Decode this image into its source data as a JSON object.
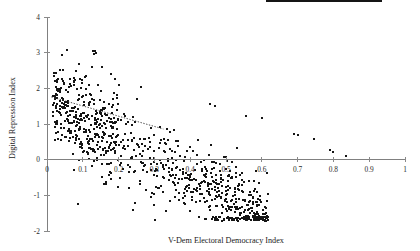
{
  "figure": {
    "width": 420,
    "height": 251,
    "background": "#ffffff",
    "marker_color": "#151515",
    "axis_color": "#808080"
  },
  "chart_data": {
    "type": "scatter",
    "title": "",
    "xlabel": "V-Dem Electoral Democracy Index",
    "ylabel": "Digital Repression Index",
    "xlim": [
      0,
      1
    ],
    "ylim": [
      -2,
      4
    ],
    "xticks": [
      0,
      0.1,
      0.2,
      0.3,
      0.4,
      0.5,
      0.6,
      0.7,
      0.8,
      0.9,
      1
    ],
    "xticklabels": [
      "0",
      "0.1",
      "0.2",
      "0.3",
      "0.4",
      "0.5",
      "0.6",
      "0.7",
      "0.8",
      "0.9",
      "1"
    ],
    "yticks": [
      -2,
      -1,
      0,
      1,
      2,
      3,
      4
    ],
    "yticklabels": [
      "-2",
      "-1",
      "0",
      "1",
      "2",
      "3",
      "4"
    ],
    "grid": false,
    "legend": null,
    "marker": "square",
    "marker_size": 2,
    "n_points": 1500,
    "annotations": [
      {
        "type": "trendline",
        "style": "dotted",
        "x": [
          0.012,
          0.325
        ],
        "y": [
          1.76,
          0.86
        ]
      }
    ],
    "series": [
      {
        "name": "country-years",
        "x": [
          0.019,
          0.022,
          0.024,
          0.026,
          0.028,
          0.021,
          0.023,
          0.027,
          0.029,
          0.031,
          0.018,
          0.025,
          0.03,
          0.033,
          0.035,
          0.02,
          0.032,
          0.034,
          0.036,
          0.038,
          0.041,
          0.043,
          0.045,
          0.047,
          0.049,
          0.051,
          0.053,
          0.055,
          0.057,
          0.059,
          0.061,
          0.063,
          0.065,
          0.067,
          0.069,
          0.071,
          0.073,
          0.075,
          0.077,
          0.079,
          0.081,
          0.083,
          0.085,
          0.087,
          0.089,
          0.091,
          0.093,
          0.095,
          0.097,
          0.099,
          0.101,
          0.103,
          0.105,
          0.107,
          0.109,
          0.111,
          0.113,
          0.115,
          0.117,
          0.119,
          0.121,
          0.123,
          0.125,
          0.127,
          0.129,
          0.131,
          0.133,
          0.135,
          0.137,
          0.139,
          0.141,
          0.143,
          0.145,
          0.147,
          0.149,
          0.151,
          0.153,
          0.155,
          0.157,
          0.159,
          0.161,
          0.163,
          0.165,
          0.167,
          0.169,
          0.171,
          0.173,
          0.175,
          0.177,
          0.179,
          0.181,
          0.183,
          0.185,
          0.187,
          0.189,
          0.191,
          0.193,
          0.195,
          0.197,
          0.199,
          0.205,
          0.21,
          0.215,
          0.22,
          0.225,
          0.23,
          0.235,
          0.24,
          0.245,
          0.25,
          0.255,
          0.26,
          0.265,
          0.27,
          0.275,
          0.28,
          0.285,
          0.29,
          0.295,
          0.3,
          0.305,
          0.31,
          0.315,
          0.32,
          0.325,
          0.33,
          0.335,
          0.34,
          0.345,
          0.35,
          0.355,
          0.36,
          0.365,
          0.37,
          0.375,
          0.38,
          0.385,
          0.39,
          0.395,
          0.4,
          0.405,
          0.41,
          0.415,
          0.42,
          0.425,
          0.43,
          0.435,
          0.44,
          0.445,
          0.45,
          0.455,
          0.46,
          0.465,
          0.47,
          0.475,
          0.48,
          0.485,
          0.49,
          0.495,
          0.5,
          0.505,
          0.51,
          0.515,
          0.52,
          0.525,
          0.53,
          0.535,
          0.54,
          0.545,
          0.55,
          0.555,
          0.56,
          0.565,
          0.57,
          0.575,
          0.58,
          0.585,
          0.59,
          0.595,
          0.6,
          0.605,
          0.61,
          0.615,
          0.62,
          0.625,
          0.63,
          0.635,
          0.64,
          0.645,
          0.65,
          0.655,
          0.66,
          0.665,
          0.67,
          0.675,
          0.68,
          0.685,
          0.69,
          0.695,
          0.7,
          0.705,
          0.71,
          0.715,
          0.72,
          0.725,
          0.73,
          0.735,
          0.74,
          0.745,
          0.75,
          0.755,
          0.76,
          0.765,
          0.77,
          0.775,
          0.78,
          0.785,
          0.79,
          0.795,
          0.8,
          0.805,
          0.81,
          0.815,
          0.82,
          0.825,
          0.83,
          0.835,
          0.84,
          0.845,
          0.85,
          0.855,
          0.86,
          0.865,
          0.87,
          0.875,
          0.88,
          0.885,
          0.89,
          0.895,
          0.9,
          0.905,
          0.91,
          0.915,
          0.92,
          0.925
        ],
        "y_trend": [
          1.75,
          1.74,
          1.73,
          1.72,
          1.71,
          1.7,
          1.69,
          1.68,
          1.67,
          1.66,
          1.65,
          1.63,
          1.62,
          1.61,
          1.6,
          1.58,
          1.57,
          1.56,
          1.54,
          1.53,
          1.52,
          1.5,
          1.49,
          1.48,
          1.46,
          1.45,
          1.44,
          1.42,
          1.41,
          1.4,
          1.38,
          1.37,
          1.36,
          1.34,
          1.33,
          1.32,
          1.3,
          1.29,
          1.28,
          1.26,
          1.25,
          1.24,
          1.22,
          1.21,
          1.2,
          1.18,
          1.17,
          1.16,
          1.14,
          1.13,
          1.11,
          1.1,
          1.09,
          1.07,
          1.06,
          1.05,
          1.03,
          1.02,
          1.0,
          0.99,
          0.98,
          0.96,
          0.95,
          0.94,
          0.92,
          0.91,
          0.9,
          0.88,
          0.87,
          0.86,
          0.84,
          0.83,
          0.82,
          0.8,
          0.79,
          0.78,
          0.76,
          0.75,
          0.74,
          0.72,
          0.71,
          0.7,
          0.68,
          0.67,
          0.66,
          0.64,
          0.63,
          0.62,
          0.6,
          0.59,
          0.58,
          0.56,
          0.55,
          0.54,
          0.52,
          0.51,
          0.5,
          0.48,
          0.47,
          0.46,
          0.43,
          0.41,
          0.38,
          0.36,
          0.33,
          0.31,
          0.28,
          0.26,
          0.23,
          0.21,
          0.18,
          0.16,
          0.13,
          0.11,
          0.08,
          0.06,
          0.03,
          0.01,
          -0.02,
          -0.04,
          -0.07,
          -0.09,
          -0.12,
          -0.14,
          -0.17,
          -0.19,
          -0.22,
          -0.24,
          -0.27,
          -0.29,
          -0.32,
          -0.34,
          -0.37,
          -0.39,
          -0.42,
          -0.44,
          -0.47,
          -0.49,
          -0.52,
          -0.54,
          -0.57,
          -0.59,
          -0.62,
          -0.64,
          -0.67,
          -0.69,
          -0.72,
          -0.74,
          -0.77,
          -0.79,
          -0.82,
          -0.84,
          -0.87,
          -0.89,
          -0.92,
          -0.94,
          -0.97,
          -0.99,
          -1.02,
          -1.04,
          -1.07,
          -1.09,
          -1.12,
          -1.14,
          -1.17,
          -1.19,
          -1.22,
          -1.24,
          -1.27,
          -1.29,
          -1.32,
          -1.34,
          -1.37,
          -1.39,
          -1.42,
          -1.44,
          -1.47,
          -1.49,
          -1.52,
          -1.54,
          -1.57,
          -1.59,
          -1.62
        ]
      }
    ]
  }
}
